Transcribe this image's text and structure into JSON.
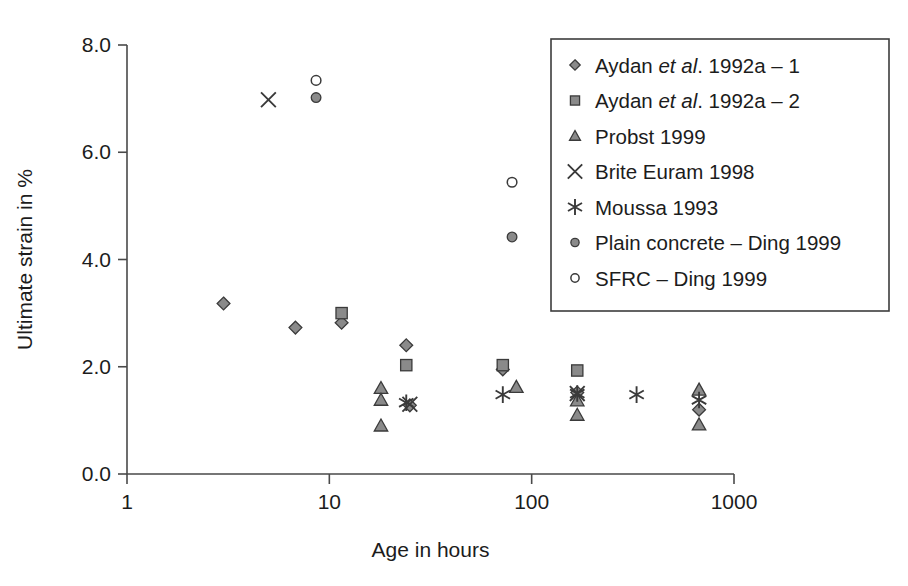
{
  "chart_data": {
    "type": "scatter",
    "title": "",
    "xlabel": "Age in hours",
    "ylabel": "Ultimate strain in %",
    "xscale": "log",
    "xlim": [
      1,
      1000
    ],
    "ylim": [
      0.0,
      8.0
    ],
    "xticks": [
      "1",
      "10",
      "100",
      "1000"
    ],
    "xtick_values": [
      1,
      10,
      100,
      1000
    ],
    "yticks": [
      "0.0",
      "2.0",
      "4.0",
      "6.0",
      "8.0"
    ],
    "ytick_values": [
      0.0,
      2.0,
      4.0,
      6.0,
      8.0
    ],
    "grid": false,
    "legend_position": "top-right",
    "series": [
      {
        "name": "Aydan et al. 1992a – 1",
        "label_parts": [
          "Aydan ",
          "et al",
          ". 1992a – 1"
        ],
        "marker": "diamond",
        "marker_style": "filled-gray",
        "points": [
          {
            "x": 3.0,
            "y": 3.18
          },
          {
            "x": 6.8,
            "y": 2.73
          },
          {
            "x": 11.5,
            "y": 2.82
          },
          {
            "x": 24.0,
            "y": 2.4
          },
          {
            "x": 25.0,
            "y": 1.28
          },
          {
            "x": 72.0,
            "y": 1.95
          },
          {
            "x": 168.0,
            "y": 1.52
          },
          {
            "x": 672.0,
            "y": 1.2
          }
        ]
      },
      {
        "name": "Aydan et al. 1992a – 2",
        "label_parts": [
          "Aydan ",
          "et al",
          ". 1992a – 2"
        ],
        "marker": "square",
        "marker_style": "filled-gray",
        "points": [
          {
            "x": 11.5,
            "y": 3.0
          },
          {
            "x": 24.0,
            "y": 2.03
          },
          {
            "x": 72.0,
            "y": 2.03
          },
          {
            "x": 168.0,
            "y": 1.93
          }
        ]
      },
      {
        "name": "Probst 1999",
        "label_parts": [
          "Probst 1999"
        ],
        "marker": "triangle",
        "marker_style": "filled-gray",
        "points": [
          {
            "x": 18.0,
            "y": 1.6
          },
          {
            "x": 18.0,
            "y": 1.38
          },
          {
            "x": 18.0,
            "y": 0.9
          },
          {
            "x": 84.0,
            "y": 1.62
          },
          {
            "x": 168.0,
            "y": 1.37
          },
          {
            "x": 168.0,
            "y": 1.1
          },
          {
            "x": 672.0,
            "y": 1.57
          },
          {
            "x": 672.0,
            "y": 0.92
          }
        ]
      },
      {
        "name": "Brite Euram 1998",
        "label_parts": [
          "Brite Euram 1998"
        ],
        "marker": "x",
        "marker_style": "stroke",
        "points": [
          {
            "x": 5.0,
            "y": 6.98
          },
          {
            "x": 25.0,
            "y": 1.3
          },
          {
            "x": 168.0,
            "y": 1.5
          }
        ]
      },
      {
        "name": "Moussa 1993",
        "label_parts": [
          "Moussa 1993"
        ],
        "marker": "asterisk",
        "marker_style": "stroke",
        "points": [
          {
            "x": 24.0,
            "y": 1.33
          },
          {
            "x": 72.0,
            "y": 1.48
          },
          {
            "x": 168.0,
            "y": 1.5
          },
          {
            "x": 330.0,
            "y": 1.48
          },
          {
            "x": 672.0,
            "y": 1.38
          }
        ]
      },
      {
        "name": "Plain concrete – Ding 1999",
        "label_parts": [
          "Plain concrete – Ding 1999"
        ],
        "marker": "circle",
        "marker_style": "filled-gray",
        "points": [
          {
            "x": 8.6,
            "y": 7.02
          },
          {
            "x": 80.0,
            "y": 4.42
          }
        ]
      },
      {
        "name": "SFRC – Ding 1999",
        "label_parts": [
          "SFRC – Ding 1999"
        ],
        "marker": "circle",
        "marker_style": "open",
        "points": [
          {
            "x": 8.6,
            "y": 7.34
          },
          {
            "x": 80.0,
            "y": 5.44
          }
        ]
      }
    ]
  },
  "axes": {
    "x_title": "Age in hours",
    "y_title": "Ultimate strain in %"
  },
  "legend": {
    "items": [
      {
        "label": "Aydan et al. 1992a – 1",
        "marker": "diamond"
      },
      {
        "label": "Aydan et al. 1992a – 2",
        "marker": "square"
      },
      {
        "label": "Probst 1999",
        "marker": "triangle"
      },
      {
        "label": "Brite Euram 1998",
        "marker": "x"
      },
      {
        "label": "Moussa 1993",
        "marker": "asterisk"
      },
      {
        "label": "Plain concrete – Ding 1999",
        "marker": "circle-filled"
      },
      {
        "label": "SFRC – Ding 1999",
        "marker": "circle-open"
      }
    ]
  },
  "colors": {
    "marker_fill": "#8a8a8a",
    "marker_stroke": "#3a3a3a",
    "axis": "#4a4a4a",
    "text": "#1c1c1c",
    "background": "#ffffff"
  }
}
